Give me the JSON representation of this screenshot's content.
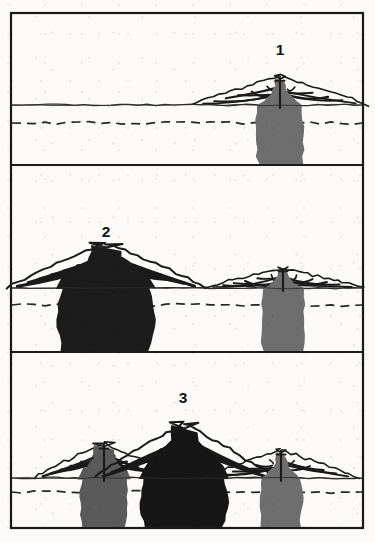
{
  "figure": {
    "width": 375,
    "height": 542,
    "background_color": "#fbfaf8",
    "frame": {
      "x": 11,
      "y": 13,
      "width": 352,
      "height": 515,
      "stroke_color": "#1a1a1a",
      "stroke_width": 2.2
    },
    "panel_dividers_y": [
      165,
      352
    ],
    "colors": {
      "ink": "#1a1a1a",
      "magma_dark": "#1c1c1c",
      "magma_gray": "#6e6e6e",
      "magma_gray_mid": "#5a5a5a",
      "paper": "#fbfaf8",
      "ground_line": "#2b2b2b",
      "dashed_line": "#262626"
    },
    "legend_note": "",
    "panels": [
      {
        "id": "panel-1",
        "label": "1",
        "label_x": 280,
        "label_y": 55,
        "stage_name": "stage-one-single-small-edifice",
        "y_top": 13,
        "y_bottom": 165,
        "ground_level_y": 105,
        "dashed_level_y": 123,
        "edifices": [
          {
            "name": "edifice-right",
            "center_x": 280,
            "summit_y": 76,
            "base_half_width": 88,
            "fill": "#6e6e6e",
            "size": "small",
            "conduit_width": 10,
            "dike_count": 11
          }
        ]
      },
      {
        "id": "panel-2",
        "label": "2",
        "label_x": 106,
        "label_y": 237,
        "stage_name": "stage-two-large-left-and-small-right",
        "y_top": 165,
        "y_bottom": 352,
        "ground_level_y": 288,
        "dashed_level_y": 305,
        "edifices": [
          {
            "name": "edifice-left",
            "center_x": 106,
            "summit_y": 243,
            "base_half_width": 100,
            "fill": "#1c1c1c",
            "size": "large",
            "conduit_width": 30,
            "dike_count": 14
          },
          {
            "name": "edifice-right",
            "center_x": 283,
            "summit_y": 268,
            "base_half_width": 80,
            "fill": "#6e6e6e",
            "size": "small",
            "conduit_width": 9,
            "dike_count": 11
          }
        ]
      },
      {
        "id": "panel-3",
        "label": "3",
        "label_x": 183,
        "label_y": 403,
        "stage_name": "stage-three-three-edifices-merged",
        "y_top": 352,
        "y_bottom": 528,
        "ground_level_y": 478,
        "dashed_level_y": 492,
        "edifices": [
          {
            "name": "edifice-left",
            "center_x": 104,
            "summit_y": 443,
            "base_half_width": 70,
            "fill": "#5a5a5a",
            "size": "medium",
            "conduit_width": 20,
            "dike_count": 12
          },
          {
            "name": "edifice-center",
            "center_x": 184,
            "summit_y": 423,
            "base_half_width": 90,
            "fill": "#161616",
            "size": "largest",
            "conduit_width": 26,
            "dike_count": 16
          },
          {
            "name": "edifice-right",
            "center_x": 281,
            "summit_y": 450,
            "base_half_width": 78,
            "fill": "#6e6e6e",
            "size": "small",
            "conduit_width": 9,
            "dike_count": 11
          }
        ]
      }
    ]
  }
}
